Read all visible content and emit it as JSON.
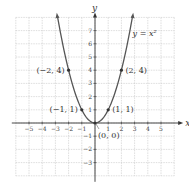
{
  "chart_data": {
    "type": "line",
    "title": "",
    "equation_label": "y = x²",
    "xlabel": "x",
    "ylabel": "y",
    "xlim": [
      -6,
      6
    ],
    "ylim": [
      -4,
      8
    ],
    "grid": true,
    "x_ticks": [
      -5,
      -4,
      -3,
      -2,
      -1,
      1,
      2,
      3,
      4,
      5
    ],
    "x_tick_labels": [
      "−5",
      "−4",
      "−3",
      "−2",
      "−1",
      "1",
      "2",
      "3",
      "4",
      "5"
    ],
    "y_ticks": [
      -3,
      -2,
      -1,
      1,
      2,
      3,
      4,
      5,
      6,
      7
    ],
    "y_tick_labels": [
      "−3",
      "−2",
      "−1",
      "1",
      "2",
      "3",
      "4",
      "5",
      "6",
      "7"
    ],
    "series": [
      {
        "name": "y = x^2",
        "function": "x^2",
        "x_range": [
          -2.85,
          2.85
        ]
      }
    ],
    "points": [
      {
        "x": -2,
        "y": 4,
        "label": "(−2, 4)"
      },
      {
        "x": 2,
        "y": 4,
        "label": "(2, 4)"
      },
      {
        "x": -1,
        "y": 1,
        "label": "(−1, 1)"
      },
      {
        "x": 1,
        "y": 1,
        "label": "(1, 1)"
      },
      {
        "x": 0,
        "y": 0,
        "label": "(0, 0)"
      }
    ]
  }
}
